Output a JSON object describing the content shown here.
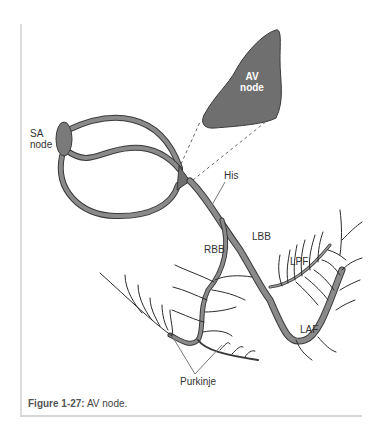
{
  "figure": {
    "caption_number": "Figure 1-27:",
    "caption_text": " AV node."
  },
  "labels": {
    "sa_node_line1": "SA",
    "sa_node_line2": "node",
    "av_node_line1": "AV",
    "av_node_line2": "node",
    "his": "His",
    "lbb": "LBB",
    "rbb": "RBB",
    "lpf": "LPF",
    "laf": "LAF",
    "purkinje": "Purkinje"
  },
  "colors": {
    "fiber_fill": "#8a8a8a",
    "fiber_stroke": "#3a3a3a",
    "node_fill": "#7a7a7a",
    "av_node_fill": "#6f6f6f",
    "branch_stroke": "#2a2a2a"
  }
}
